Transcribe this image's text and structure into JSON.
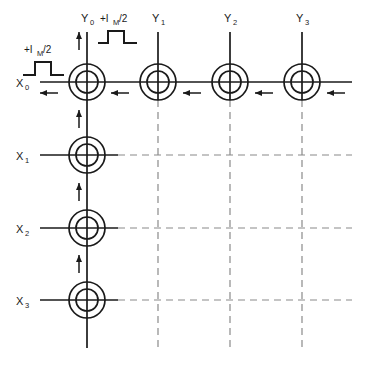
{
  "figure": {
    "type": "core-memory-matrix",
    "background_color": "#ffffff",
    "line_color": "#1a1a1a",
    "dashed_color": "#8a8a8a"
  },
  "row_labels": [
    {
      "id": "x0",
      "text": "X",
      "subscript": "0"
    },
    {
      "id": "x1",
      "text": "X",
      "subscript": "1"
    },
    {
      "id": "x2",
      "text": "X",
      "subscript": "2"
    },
    {
      "id": "x3",
      "text": "X",
      "subscript": "3"
    }
  ],
  "column_labels": [
    {
      "id": "y0",
      "text": "Y",
      "subscript": "0"
    },
    {
      "id": "y1",
      "text": "Y",
      "subscript": "1"
    },
    {
      "id": "y2",
      "text": "Y",
      "subscript": "2"
    },
    {
      "id": "y3",
      "text": "Y",
      "subscript": "3"
    }
  ],
  "pulse_annotations": [
    {
      "id": "x-drive-pulse",
      "prefix": "+I",
      "subscript": "M",
      "suffix": " /2"
    },
    {
      "id": "y-drive-pulse",
      "prefix": "+I",
      "subscript": "M",
      "suffix": " /2"
    }
  ],
  "geometry": {
    "columns_x": [
      87,
      158,
      230,
      302
    ],
    "rows_y": [
      82,
      155,
      228,
      300
    ],
    "core_outer_radius": 18,
    "core_inner_radius": 11,
    "row_line_left_x": 40,
    "row_line_right_x": 352,
    "col_line_top_y": 32,
    "col_line_bottom_y": 348
  },
  "current_arrows": {
    "row_direction": "left",
    "row_count": 4,
    "column_direction": "up",
    "column_count": 3
  },
  "core_count": 16,
  "energized_row": "X0",
  "energized_column": "Y0"
}
